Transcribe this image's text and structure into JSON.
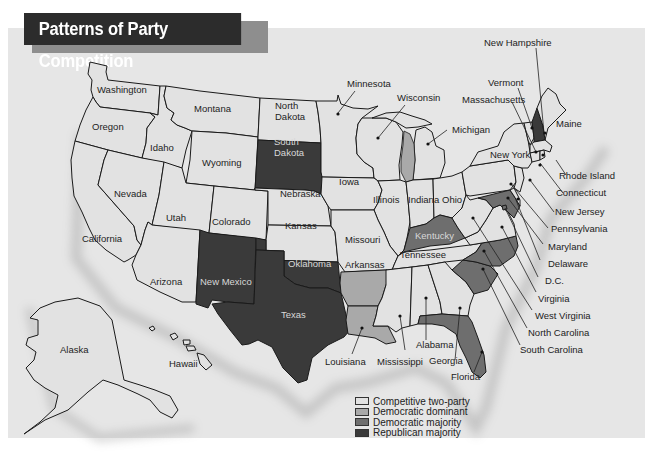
{
  "title": "Patterns of Party Competition",
  "colors": {
    "competitive_two_party": "#e2e2e2",
    "democratic_dominant": "#a9a9a9",
    "democratic_majority": "#6e6e6e",
    "republican_majority": "#3a3a3a",
    "background": "#e6e6e6"
  },
  "legend": [
    {
      "key": "competitive_two_party",
      "label": "Competitive two-party",
      "color": "#e2e2e2"
    },
    {
      "key": "democratic_dominant",
      "label": "Democratic dominant",
      "color": "#a9a9a9"
    },
    {
      "key": "democratic_majority",
      "label": "Democratic majority",
      "color": "#6e6e6e"
    },
    {
      "key": "republican_majority",
      "label": "Republican majority",
      "color": "#3a3a3a"
    }
  ],
  "states": {
    "washington": {
      "label": "Washington",
      "category": "competitive_two_party"
    },
    "oregon": {
      "label": "Oregon",
      "category": "competitive_two_party"
    },
    "california": {
      "label": "California",
      "category": "competitive_two_party"
    },
    "idaho": {
      "label": "Idaho",
      "category": "competitive_two_party"
    },
    "nevada": {
      "label": "Nevada",
      "category": "competitive_two_party"
    },
    "montana": {
      "label": "Montana",
      "category": "competitive_two_party"
    },
    "wyoming": {
      "label": "Wyoming",
      "category": "competitive_two_party"
    },
    "utah": {
      "label": "Utah",
      "category": "competitive_two_party"
    },
    "arizona": {
      "label": "Arizona",
      "category": "competitive_two_party"
    },
    "colorado": {
      "label": "Colorado",
      "category": "competitive_two_party"
    },
    "new_mexico": {
      "label": "New Mexico",
      "category": "republican_majority"
    },
    "north_dakota": {
      "label": "North",
      "label2": "Dakota",
      "category": "competitive_two_party"
    },
    "south_dakota": {
      "label": "South",
      "label2": "Dakota",
      "category": "republican_majority"
    },
    "nebraska": {
      "label": "Nebraska",
      "category": "competitive_two_party"
    },
    "kansas": {
      "label": "Kansas",
      "category": "competitive_two_party"
    },
    "oklahoma": {
      "label": "Oklahoma",
      "category": "republican_majority"
    },
    "texas": {
      "label": "Texas",
      "category": "republican_majority"
    },
    "minnesota": {
      "label": "Minnesota",
      "category": "competitive_two_party"
    },
    "iowa": {
      "label": "Iowa",
      "category": "competitive_two_party"
    },
    "missouri": {
      "label": "Missouri",
      "category": "competitive_two_party"
    },
    "arkansas": {
      "label": "Arkansas",
      "category": "democratic_dominant"
    },
    "louisiana": {
      "label": "Louisiana",
      "category": "democratic_dominant"
    },
    "wisconsin": {
      "label": "Wisconsin",
      "category": "competitive_two_party"
    },
    "illinois": {
      "label": "Illinois",
      "category": "competitive_two_party"
    },
    "michigan": {
      "label": "Michigan",
      "category": "competitive_two_party"
    },
    "indiana": {
      "label": "Indiana",
      "category": "competitive_two_party"
    },
    "ohio": {
      "label": "Ohio",
      "category": "competitive_two_party"
    },
    "kentucky": {
      "label": "Kentucky",
      "category": "democratic_majority"
    },
    "tennessee": {
      "label": "Tennessee",
      "category": "competitive_two_party"
    },
    "mississippi": {
      "label": "Mississippi",
      "category": "competitive_two_party"
    },
    "alabama": {
      "label": "Alabama",
      "category": "competitive_two_party"
    },
    "georgia": {
      "label": "Georgia",
      "category": "competitive_two_party"
    },
    "florida": {
      "label": "Florida",
      "category": "democratic_majority"
    },
    "south_carolina": {
      "label": "South Carolina",
      "category": "democratic_majority"
    },
    "north_carolina": {
      "label": "North Carolina",
      "category": "democratic_majority"
    },
    "virginia": {
      "label": "Virginia",
      "category": "competitive_two_party"
    },
    "west_virginia": {
      "label": "West Virginia",
      "category": "competitive_two_party"
    },
    "maryland": {
      "label": "Maryland",
      "category": "democratic_majority"
    },
    "delaware": {
      "label": "Delaware",
      "category": "competitive_two_party"
    },
    "dc": {
      "label": "D.C.",
      "category": "democratic_majority"
    },
    "pennsylvania": {
      "label": "Pennsylvania",
      "category": "competitive_two_party"
    },
    "new_jersey": {
      "label": "New Jersey",
      "category": "competitive_two_party"
    },
    "new_york": {
      "label": "New York",
      "category": "competitive_two_party"
    },
    "connecticut": {
      "label": "Connecticut",
      "category": "competitive_two_party"
    },
    "rhode_island": {
      "label": "Rhode Island",
      "category": "competitive_two_party"
    },
    "massachusetts": {
      "label": "Massachusetts",
      "category": "competitive_two_party"
    },
    "vermont": {
      "label": "Vermont",
      "category": "competitive_two_party"
    },
    "new_hampshire": {
      "label": "New Hampshire",
      "category": "republican_majority"
    },
    "maine": {
      "label": "Maine",
      "category": "competitive_two_party"
    },
    "alaska": {
      "label": "Alaska",
      "category": "competitive_two_party"
    },
    "hawaii": {
      "label": "Hawaii",
      "category": "competitive_two_party"
    }
  }
}
